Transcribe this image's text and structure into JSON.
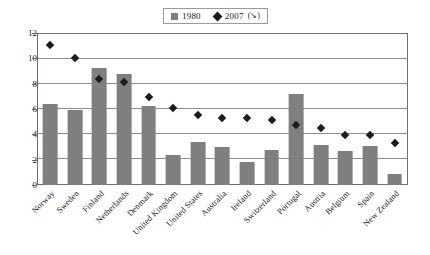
{
  "chart_data": {
    "type": "bar",
    "title": "",
    "xlabel": "",
    "ylabel": "",
    "ylim": [
      0,
      12
    ],
    "yticks": [
      0,
      2,
      4,
      6,
      8,
      10,
      12
    ],
    "grid": true,
    "legend_position": "top-center",
    "categories": [
      "Norway",
      "Sweden",
      "Finland",
      "Netherlands",
      "Denmark",
      "United Kingdom",
      "United States",
      "Australia",
      "Ireland",
      "Switzerland",
      "Portugal",
      "Austria",
      "Belgium",
      "Spain",
      "New Zealand"
    ],
    "series": [
      {
        "name": "1980",
        "type": "bar",
        "color": "#7f7f7f",
        "values": [
          6.4,
          6.0,
          9.3,
          8.8,
          6.3,
          2.4,
          3.4,
          3.0,
          1.8,
          2.8,
          7.2,
          3.2,
          2.7,
          3.1,
          0.9
        ]
      },
      {
        "name": "2007",
        "type": "scatter",
        "marker": "diamond",
        "color": "#1c1c1c",
        "values": [
          11.1,
          10.1,
          8.4,
          8.2,
          7.0,
          6.1,
          5.6,
          5.3,
          5.3,
          5.2,
          4.8,
          4.5,
          4.0,
          4.0,
          3.3
        ]
      }
    ]
  },
  "legend": {
    "entries": [
      {
        "label": "1980",
        "suffix": "",
        "marker": "square"
      },
      {
        "label": "2007",
        "suffix": "(↘)",
        "marker": "diamond"
      }
    ]
  }
}
